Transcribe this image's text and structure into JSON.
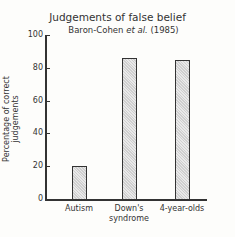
{
  "chart_data": {
    "type": "bar",
    "title": "Judgements of false belief",
    "subtitle": "Baron-Cohen et al. (1985)",
    "xlabel": "",
    "ylabel": "Percentage of correct judgements",
    "ylim": [
      0,
      100
    ],
    "yticks": [
      0,
      20,
      40,
      60,
      80,
      100
    ],
    "grid": false,
    "categories": [
      "Autism",
      "Down's syndrome",
      "4-year-olds"
    ],
    "values": [
      20,
      86,
      85
    ]
  },
  "header": {
    "title": "Judgements of false belief",
    "subtitle_author": "Baron-Cohen ",
    "subtitle_etal": "et al.",
    "subtitle_year": " (1985)"
  },
  "axis": {
    "ylabel": "Percentage of correct judgements",
    "ticks": [
      "0",
      "20",
      "40",
      "60",
      "80",
      "100"
    ]
  },
  "bars": [
    {
      "label_line1": "Autism",
      "label_line2": ""
    },
    {
      "label_line1": "Down's",
      "label_line2": "syndrome"
    },
    {
      "label_line1": "4-year-olds",
      "label_line2": ""
    }
  ]
}
